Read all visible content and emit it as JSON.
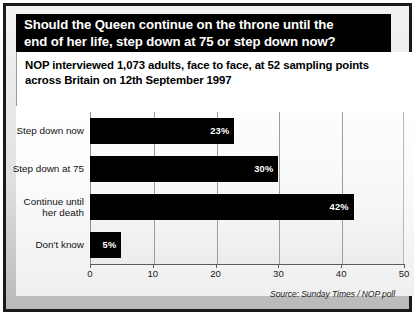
{
  "title": {
    "line1": "Should the Queen continue on the throne until the",
    "line2": "end of her life, step down at 75 or step down now?"
  },
  "subtitle": {
    "line1": "NOP interviewed 1,073 adults, face to face, at 52 sampling points",
    "line2": "across Britain on 12th September 1997"
  },
  "source": "Source: Sunday Times / NOP poll",
  "colors": {
    "bar": "#000000",
    "title_background": "#000000",
    "title_text": "#ffffff",
    "panel_background": "#d9d9d9",
    "gridline": "#9d9d9d"
  },
  "chart_data": {
    "type": "bar",
    "orientation": "horizontal",
    "title": "Should the Queen continue on the throne until the end of her life, step down at 75 or step down now?",
    "subtitle": "NOP interviewed 1,073 adults, face to face, at 52 sampling points across Britain on 12th September 1997",
    "categories": [
      "Step down now",
      "Step down at 75",
      "Continue until\nher death",
      "Don't know"
    ],
    "values": [
      23,
      30,
      42,
      5
    ],
    "data_labels": [
      "23%",
      "30%",
      "42%",
      "5%"
    ],
    "xlabel": "",
    "ylabel": "",
    "xlim": [
      0,
      50
    ],
    "xticks": [
      0,
      10,
      20,
      30,
      40,
      50
    ],
    "xtick_labels": [
      "0",
      "10",
      "20",
      "30",
      "40",
      "50"
    ],
    "grid": true,
    "grid_axis": "x",
    "legend": false,
    "annotations": [
      "Source: Sunday Times / NOP poll"
    ]
  }
}
